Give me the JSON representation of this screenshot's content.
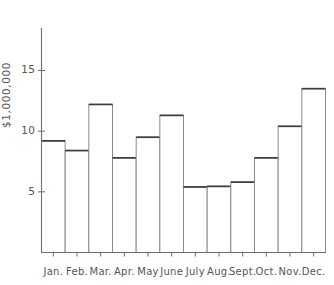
{
  "chart_data": {
    "type": "bar",
    "title": "",
    "subtitle": "",
    "xlabel": "",
    "ylabel": "$1,000,000",
    "categories": [
      "Jan.",
      "Feb.",
      "Mar.",
      "Apr.",
      "May",
      "June",
      "July",
      "Aug.",
      "Sept.",
      "Oct.",
      "Nov.",
      "Dec."
    ],
    "values": [
      9.2,
      8.4,
      12.2,
      7.8,
      9.5,
      11.3,
      5.4,
      5.45,
      5.8,
      7.8,
      10.4,
      13.5
    ],
    "ylim": [
      0,
      18.5
    ],
    "y_ticks": [
      5,
      10,
      15
    ],
    "y_tick_labels": [
      "5",
      "10",
      "15"
    ],
    "grid": false,
    "legend": false,
    "legend_position": "none",
    "series": [
      {
        "name": "",
        "values": [
          9.2,
          8.4,
          12.2,
          7.8,
          9.5,
          11.3,
          5.4,
          5.45,
          5.8,
          7.8,
          10.4,
          13.5
        ]
      }
    ],
    "annotations": [],
    "style": {
      "bar_fill": "#ffffff",
      "bar_outline": "#8a8a8a",
      "bar_top": "#3d3d3d",
      "axis": "#6e6e6e",
      "text": "#555555",
      "background": "#ffffff"
    }
  }
}
